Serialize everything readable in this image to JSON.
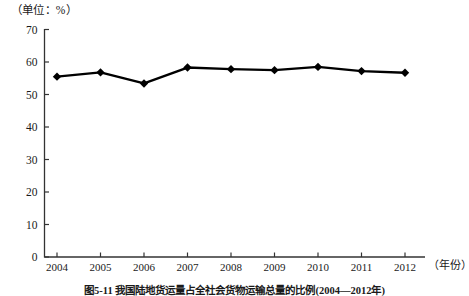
{
  "chart_data": {
    "type": "line",
    "title": "",
    "unit_label": "（单位：%）",
    "xlabel": "（年份）",
    "ylabel": "",
    "categories": [
      "2004",
      "2005",
      "2006",
      "2007",
      "2008",
      "2009",
      "2010",
      "2011",
      "2012"
    ],
    "values": [
      55.5,
      56.8,
      53.4,
      58.3,
      57.8,
      57.5,
      58.5,
      57.2,
      56.7
    ],
    "ylim": [
      0,
      70
    ],
    "ytick_step": 10,
    "yticks": [
      "0",
      "10",
      "20",
      "30",
      "40",
      "50",
      "60",
      "70"
    ],
    "grid": false,
    "legend": "none",
    "marker": "diamond",
    "series_color": "#000000",
    "axis_color": "#333333"
  },
  "caption": {
    "text": "图5-11 我国陆地货运量占全社会货物运输总量的比例(2004—2012年)"
  }
}
